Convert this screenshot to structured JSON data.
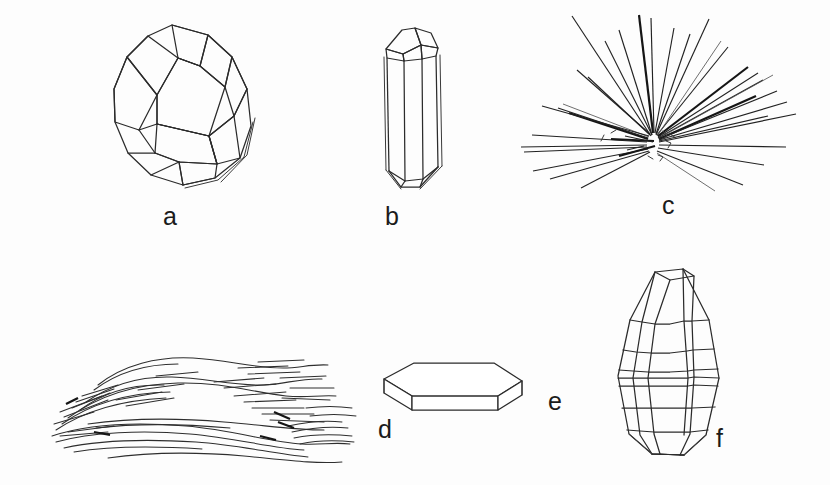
{
  "figure": {
    "background_color": "#ffffff",
    "ink_color": "#2b2b2b",
    "label_color": "#1b1b1b",
    "width": 830,
    "height": 485,
    "panels": [
      {
        "id": "a",
        "label": "a",
        "habit": "equant-dodecahedral-crystal",
        "description": "Equant isometric crystal, rhombic-dodecahedron habit drawn in oblique view with rhombic faces",
        "label_x": 163,
        "label_y": 204
      },
      {
        "id": "b",
        "label": "b",
        "habit": "prismatic-columnar-crystal",
        "description": "Elongated prismatic crystal: hexagonal prism with pyramidal termination at top",
        "label_x": 391,
        "label_y": 204
      },
      {
        "id": "c",
        "label": "c",
        "habit": "acicular-radiating-aggregate",
        "description": "Acicular needles radiating outward from a common central point",
        "label_x": 662,
        "label_y": 203
      },
      {
        "id": "d",
        "label": "d",
        "habit": "fibrous-foliated-aggregate",
        "description": "Fibrous, wavy foliated aggregate of elongated parallel fibres",
        "label_x": 378,
        "label_y": 434
      },
      {
        "id": "e",
        "label": "e",
        "habit": "tabular-platy-crystal",
        "description": "Tabular platy crystal: flattened hexagonal plate in oblique view",
        "label_x": 548,
        "label_y": 404
      },
      {
        "id": "f",
        "habit": "barrel-shaped-striated-crystal",
        "label": "f",
        "description": "Barrel-shaped crystal with horizontal striations across prism faces",
        "label_x": 716,
        "label_y": 430
      }
    ]
  }
}
